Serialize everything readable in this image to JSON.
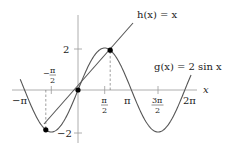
{
  "figure": {
    "functions": [
      {
        "name": "h",
        "label": "h(x) = x",
        "expr": "x"
      },
      {
        "name": "g",
        "label": "g(x) = 2 sin x",
        "expr": "2*sin(x)"
      }
    ],
    "axis_labels": {
      "x": "x"
    },
    "x_ticks": [
      {
        "value": -3.14159,
        "label": "−π"
      },
      {
        "value": -1.5708,
        "label_num": "π",
        "label_sign": "−",
        "label_den": "2"
      },
      {
        "value": 1.5708,
        "label_num": "π",
        "label_den": "2"
      },
      {
        "value": 3.14159,
        "label": "π"
      },
      {
        "value": 4.7124,
        "label_num": "3π",
        "label_den": "2"
      },
      {
        "value": 6.28319,
        "label": "2π"
      }
    ],
    "y_ticks": [
      {
        "value": 2,
        "label": "2"
      },
      {
        "value": -2,
        "label": "−2"
      }
    ],
    "intersection_points": [
      {
        "x": -1.895,
        "y": -1.895
      },
      {
        "x": 0,
        "y": 0
      },
      {
        "x": 1.895,
        "y": 1.895
      }
    ],
    "colors": {
      "curve": "#555555",
      "axis": "#888888",
      "point": "#000000"
    }
  }
}
